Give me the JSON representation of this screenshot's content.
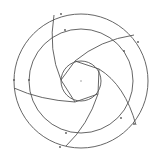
{
  "diagram": {
    "title": "",
    "stroke_color": "#555555",
    "background": "#ffffff",
    "center": [
      81,
      81
    ],
    "circles": [
      {
        "name": "outer-circle",
        "r": 67
      },
      {
        "name": "middle-circle",
        "r": 52
      },
      {
        "name": "inner-circle",
        "r": 20
      }
    ],
    "pentagon": [
      [
        75,
        61
      ],
      [
        99,
        69
      ],
      [
        98,
        94
      ],
      [
        75,
        102
      ],
      [
        61,
        80
      ]
    ],
    "spiral_arcs": [
      {
        "from": [
          61,
          80
        ],
        "to": [
          54,
          15
        ],
        "ctrl": [
          48,
          50
        ]
      },
      {
        "from": [
          75,
          61
        ],
        "to": [
          134,
          35
        ],
        "ctrl": [
          100,
          40
        ]
      },
      {
        "from": [
          99,
          69
        ],
        "to": [
          136,
          125
        ],
        "ctrl": [
          125,
          85
        ]
      },
      {
        "from": [
          98,
          94
        ],
        "to": [
          66,
          146
        ],
        "ctrl": [
          88,
          125
        ]
      },
      {
        "from": [
          75,
          102
        ],
        "to": [
          14,
          88
        ],
        "ctrl": [
          40,
          100
        ]
      }
    ],
    "tick_marks": [
      [
        61,
        14
      ],
      [
        65,
        30
      ],
      [
        138,
        42
      ],
      [
        124,
        51
      ],
      [
        14,
        80
      ],
      [
        29,
        80
      ],
      [
        134,
        124
      ],
      [
        121,
        118
      ],
      [
        60,
        147
      ],
      [
        66,
        133
      ]
    ]
  }
}
